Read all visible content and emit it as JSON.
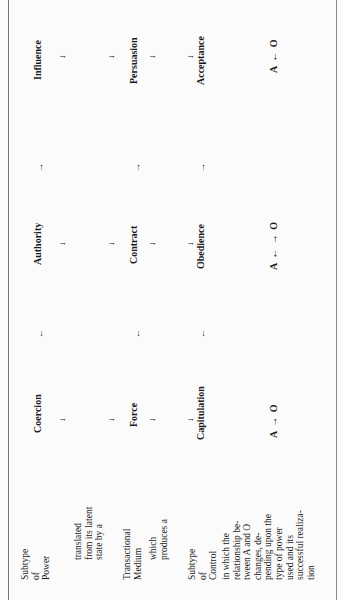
{
  "labels": {
    "subtype_power": [
      "Subtype",
      "of",
      "Power"
    ],
    "translated": [
      "translated",
      "from its latent",
      "state by a"
    ],
    "medium": [
      "Transactional",
      "Medium"
    ],
    "produces": [
      "which",
      "produces a"
    ],
    "subtype_control": [
      "Subtype",
      "of",
      "Control"
    ],
    "relationship": [
      "in which the",
      "relationship be-",
      "tween A and O",
      "changes, de-",
      "pending upon the",
      "type of power",
      "used and its",
      "successful realiza-",
      "tion"
    ]
  },
  "columns": [
    {
      "power": "Coercion",
      "medium": "Force",
      "control": "Capitulation",
      "relation": "A → O",
      "left_arrow": "←"
    },
    {
      "power": "Authority",
      "medium": "Contract",
      "control": "Obedience",
      "relation": "A ← → O",
      "left_arrow": "←",
      "right_arrow": "→"
    },
    {
      "power": "Influence",
      "medium": "Persuasion",
      "control": "Acceptance",
      "relation": "A ← O",
      "right_arrow": "→"
    }
  ],
  "arrows": {
    "down": "↓",
    "left": "←",
    "right": "→"
  }
}
